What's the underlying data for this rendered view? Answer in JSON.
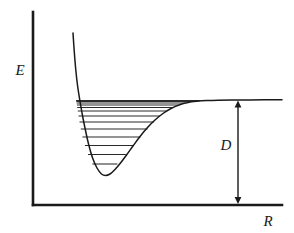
{
  "figure": {
    "kind": "potential-energy-curve"
  },
  "axes": {
    "y_label": "E",
    "x_label": "R",
    "color": "#1a1a1a",
    "origin_x": 33,
    "origin_y": 205,
    "y_top": 12,
    "x_right": 282
  },
  "annotations": {
    "dissociation_label": "D"
  },
  "chart_data": {
    "type": "line",
    "title": "",
    "xlabel": "R",
    "ylabel": "E",
    "grid": false,
    "legend": null,
    "xlim": [
      33,
      282
    ],
    "ylim": [
      205,
      12
    ],
    "series": [
      {
        "name": "morse-potential",
        "color": "#1a1a1a",
        "points": [
          [
            73.0,
            33.0
          ],
          [
            74.3,
            52.0
          ],
          [
            75.8,
            70.0
          ],
          [
            77.6,
            86.0
          ],
          [
            79.8,
            100.0
          ],
          [
            82.4,
            115.0
          ],
          [
            85.4,
            130.0
          ],
          [
            88.8,
            145.0
          ],
          [
            92.6,
            158.0
          ],
          [
            97.0,
            168.0
          ],
          [
            101.5,
            174.0
          ],
          [
            105.5,
            175.5
          ],
          [
            110.0,
            174.0
          ],
          [
            115.0,
            169.5
          ],
          [
            120.5,
            163.0
          ],
          [
            126.5,
            155.0
          ],
          [
            133.0,
            146.0
          ],
          [
            140.0,
            136.5
          ],
          [
            147.5,
            127.5
          ],
          [
            155.0,
            120.0
          ],
          [
            163.0,
            113.5
          ],
          [
            171.0,
            108.5
          ],
          [
            179.0,
            105.0
          ],
          [
            188.0,
            102.5
          ],
          [
            197.0,
            101.3
          ],
          [
            207.0,
            100.6
          ],
          [
            218.0,
            100.2
          ],
          [
            232.0,
            100.0
          ],
          [
            250.0,
            99.9
          ],
          [
            282.0,
            99.8
          ]
        ]
      }
    ],
    "energy_levels": [
      {
        "index": 0,
        "y": 164.0,
        "x_left": 92.4,
        "x_right": 117.4
      },
      {
        "index": 1,
        "y": 154.5,
        "x_left": 88.0,
        "x_right": 125.8
      },
      {
        "index": 2,
        "y": 145.5,
        "x_left": 84.9,
        "x_right": 133.5
      },
      {
        "index": 3,
        "y": 137.0,
        "x_left": 82.5,
        "x_right": 140.5
      },
      {
        "index": 4,
        "y": 129.0,
        "x_left": 80.8,
        "x_right": 147.6
      },
      {
        "index": 5,
        "y": 122.0,
        "x_left": 79.5,
        "x_right": 154.0
      },
      {
        "index": 6,
        "y": 116.0,
        "x_left": 78.5,
        "x_right": 160.0
      },
      {
        "index": 7,
        "y": 111.0,
        "x_left": 77.8,
        "x_right": 166.5
      },
      {
        "index": 8,
        "y": 107.5,
        "x_left": 77.2,
        "x_right": 172.5
      },
      {
        "index": 9,
        "y": 105.0,
        "x_left": 76.9,
        "x_right": 178.5
      },
      {
        "index": 10,
        "y": 103.0,
        "x_left": 76.6,
        "x_right": 185.0
      },
      {
        "index": 11,
        "y": 101.5,
        "x_left": 76.3,
        "x_right": 192.0
      },
      {
        "index": 12,
        "y": 100.4,
        "x_left": 76.1,
        "x_right": 200.0
      }
    ],
    "dissociation_arrow": {
      "label": "D",
      "x": 238,
      "y_top": 100.5,
      "y_bottom": 204.0,
      "label_x": 226,
      "label_y": 150
    },
    "annotations": [
      {
        "text": "E",
        "x": 20,
        "y": 75,
        "role": "y-axis-label"
      },
      {
        "text": "R",
        "x": 268,
        "y": 226,
        "role": "x-axis-label"
      },
      {
        "text": "D",
        "x": 226,
        "y": 150,
        "role": "dissociation-energy-label"
      }
    ]
  }
}
